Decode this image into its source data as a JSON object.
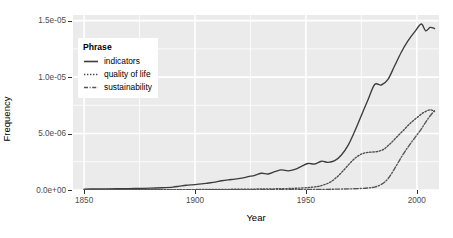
{
  "chart_data": {
    "type": "line",
    "title": "",
    "xlabel": "Year",
    "ylabel": "Frequency",
    "xlim": [
      1845,
      2010
    ],
    "ylim": [
      0,
      1.55e-05
    ],
    "grid": true,
    "legend_position": "inside-top-left",
    "legend_title": "Phrase",
    "xticks": [
      1850,
      1900,
      1950,
      2000
    ],
    "xticklabels": [
      "1850",
      "1900",
      "1950",
      "2000"
    ],
    "yticks": [
      0,
      5e-06,
      1e-05,
      1.5e-05
    ],
    "yticklabels": [
      "0.0e+00",
      "5.0e-06",
      "1.0e-05",
      "1.5e-05"
    ],
    "series": [
      {
        "name": "indicators",
        "style": "solid",
        "color": "#3c3c3c",
        "x": [
          1850,
          1855,
          1860,
          1865,
          1870,
          1875,
          1880,
          1885,
          1890,
          1893,
          1896,
          1900,
          1903,
          1906,
          1909,
          1912,
          1915,
          1918,
          1921,
          1924,
          1927,
          1930,
          1933,
          1936,
          1939,
          1942,
          1945,
          1948,
          1951,
          1954,
          1957,
          1960,
          1963,
          1966,
          1969,
          1972,
          1975,
          1978,
          1981,
          1984,
          1987,
          1990,
          1993,
          1996,
          1999,
          2002,
          2004,
          2006,
          2008
        ],
        "y": [
          8e-08,
          9e-08,
          1e-07,
          1.1e-07,
          1.2e-07,
          1.4e-07,
          1.6e-07,
          2e-07,
          2.6e-07,
          3.4e-07,
          4.2e-07,
          4.8e-07,
          5.4e-07,
          6.2e-07,
          7e-07,
          8.2e-07,
          9e-07,
          9.6e-07,
          1.05e-06,
          1.18e-06,
          1.3e-06,
          1.48e-06,
          1.42e-06,
          1.62e-06,
          1.78e-06,
          1.7e-06,
          1.82e-06,
          2.1e-06,
          2.35e-06,
          2.3e-06,
          2.55e-06,
          2.45e-06,
          2.6e-06,
          3.1e-06,
          3.95e-06,
          5.2e-06,
          6.6e-06,
          8e-06,
          9.35e-06,
          9.3e-06,
          9.8e-06,
          1.1e-05,
          1.22e-05,
          1.32e-05,
          1.4e-05,
          1.47e-05,
          1.41e-05,
          1.44e-05,
          1.43e-05
        ]
      },
      {
        "name": "quality of life",
        "style": "dotted",
        "color": "#4d4d4d",
        "x": [
          1850,
          1870,
          1890,
          1900,
          1910,
          1920,
          1930,
          1940,
          1945,
          1950,
          1955,
          1958,
          1961,
          1964,
          1967,
          1970,
          1973,
          1976,
          1979,
          1982,
          1985,
          1988,
          1991,
          1994,
          1997,
          2000,
          2003,
          2006,
          2008
        ],
        "y": [
          2e-08,
          2e-08,
          3e-08,
          4e-08,
          5e-08,
          7e-08,
          9e-08,
          1.2e-07,
          1.5e-07,
          2e-07,
          3e-07,
          4.5e-07,
          7e-07,
          1.15e-06,
          1.75e-06,
          2.4e-06,
          2.95e-06,
          3.25e-06,
          3.35e-06,
          3.4e-06,
          3.6e-06,
          4.1e-06,
          4.7e-06,
          5.3e-06,
          5.9e-06,
          6.4e-06,
          6.85e-06,
          7.1e-06,
          6.95e-06
        ]
      },
      {
        "name": "sustainability",
        "style": "dashdot",
        "color": "#555555",
        "x": [
          1850,
          1880,
          1900,
          1920,
          1940,
          1950,
          1960,
          1965,
          1970,
          1975,
          1978,
          1981,
          1984,
          1987,
          1990,
          1993,
          1996,
          1999,
          2002,
          2005,
          2008
        ],
        "y": [
          1e-08,
          1e-08,
          2e-08,
          2e-08,
          3e-08,
          4e-08,
          6e-08,
          8e-08,
          1e-07,
          1.4e-07,
          1.8e-07,
          2.6e-07,
          5e-07,
          1e-06,
          1.9e-06,
          2.9e-06,
          3.8e-06,
          4.6e-06,
          5.4e-06,
          6.3e-06,
          7.05e-06
        ]
      }
    ]
  },
  "axes": {
    "y_title": "Frequency",
    "x_title": "Year",
    "y_ticks": [
      "1.5e-05",
      "1.0e-05",
      "5.0e-06",
      "0.0e+00"
    ],
    "x_ticks": [
      "1850",
      "1900",
      "1950",
      "2000"
    ]
  },
  "legend": {
    "title": "Phrase",
    "items": [
      {
        "label": "indicators",
        "key": "solid-line-key"
      },
      {
        "label": "quality of life",
        "key": "dotted-line-key"
      },
      {
        "label": "sustainability",
        "key": "dashdot-line-key"
      }
    ]
  },
  "style": {
    "panel_bg": "#ebebeb",
    "grid_color": "#ffffff",
    "line_color": "#3c3c3c",
    "tick_text_color": "#4d4d4d",
    "page_bg": "#ffffff"
  }
}
